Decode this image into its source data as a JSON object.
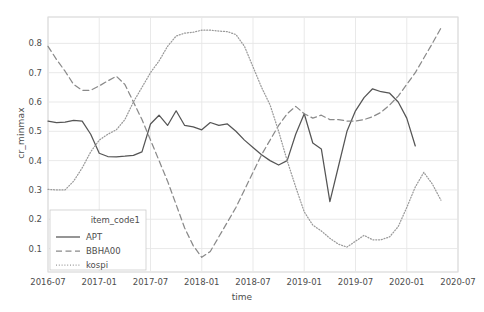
{
  "chart_data": {
    "type": "line",
    "title": "",
    "xlabel": "time",
    "ylabel": "cr_minmax",
    "legend_title": "item_code1",
    "legend_position": "lower left",
    "grid": true,
    "xlim": [
      "2016-07",
      "2020-07"
    ],
    "ylim": [
      0.02,
      0.89
    ],
    "xticks": [
      "2016-07",
      "2017-01",
      "2017-07",
      "2018-01",
      "2018-07",
      "2019-01",
      "2019-07",
      "2020-01",
      "2020-07"
    ],
    "yticks": [
      0.1,
      0.2,
      0.3,
      0.4,
      0.5,
      0.6,
      0.7,
      0.8
    ],
    "colors": {
      "APT": "#555555",
      "BBHA00": "#8a8a8a",
      "kospi": "#9a9a9a",
      "grid": "#e6e6e6",
      "axis": "#cccccc",
      "text": "#4d4d4d"
    },
    "series": [
      {
        "name": "APT",
        "style": "solid",
        "x": [
          "2016-07",
          "2016-08",
          "2016-09",
          "2016-10",
          "2016-11",
          "2016-12",
          "2017-01",
          "2017-02",
          "2017-03",
          "2017-04",
          "2017-05",
          "2017-06",
          "2017-07",
          "2017-08",
          "2017-09",
          "2017-10",
          "2017-11",
          "2017-12",
          "2018-01",
          "2018-02",
          "2018-03",
          "2018-04",
          "2018-05",
          "2018-06",
          "2018-07",
          "2018-08",
          "2018-09",
          "2018-10",
          "2018-11",
          "2018-12",
          "2019-01",
          "2019-02",
          "2019-03",
          "2019-04",
          "2019-05",
          "2019-06",
          "2019-07",
          "2019-08",
          "2019-09",
          "2019-10",
          "2019-11",
          "2019-12",
          "2020-01",
          "2020-02"
        ],
        "y": [
          0.535,
          0.53,
          0.531,
          0.537,
          0.535,
          0.49,
          0.425,
          0.414,
          0.413,
          0.415,
          0.418,
          0.43,
          0.525,
          0.555,
          0.52,
          0.57,
          0.52,
          0.515,
          0.505,
          0.53,
          0.52,
          0.525,
          0.5,
          0.47,
          0.445,
          0.42,
          0.4,
          0.385,
          0.4,
          0.49,
          0.56,
          0.46,
          0.44,
          0.26,
          0.38,
          0.5,
          0.57,
          0.615,
          0.645,
          0.635,
          0.63,
          0.6,
          0.545,
          0.45
        ]
      },
      {
        "name": "BBHA00",
        "style": "dashed",
        "x": [
          "2016-07",
          "2016-08",
          "2016-09",
          "2016-10",
          "2016-11",
          "2016-12",
          "2017-01",
          "2017-02",
          "2017-03",
          "2017-04",
          "2017-05",
          "2017-06",
          "2017-07",
          "2017-08",
          "2017-09",
          "2017-10",
          "2017-11",
          "2017-12",
          "2018-01",
          "2018-02",
          "2018-03",
          "2018-04",
          "2018-05",
          "2018-06",
          "2018-07",
          "2018-08",
          "2018-09",
          "2018-10",
          "2018-11",
          "2018-12",
          "2019-01",
          "2019-02",
          "2019-03",
          "2019-04",
          "2019-05",
          "2019-06",
          "2019-07",
          "2019-08",
          "2019-09",
          "2019-10",
          "2019-11",
          "2019-12",
          "2020-01",
          "2020-02",
          "2020-03",
          "2020-04",
          "2020-05"
        ],
        "y": [
          0.79,
          0.745,
          0.705,
          0.66,
          0.64,
          0.64,
          0.655,
          0.672,
          0.688,
          0.66,
          0.6,
          0.54,
          0.47,
          0.4,
          0.33,
          0.25,
          0.17,
          0.11,
          0.07,
          0.09,
          0.14,
          0.19,
          0.24,
          0.3,
          0.36,
          0.42,
          0.47,
          0.52,
          0.56,
          0.585,
          0.56,
          0.545,
          0.555,
          0.54,
          0.54,
          0.535,
          0.535,
          0.54,
          0.55,
          0.565,
          0.59,
          0.62,
          0.66,
          0.7,
          0.75,
          0.8,
          0.852
        ]
      },
      {
        "name": "kospi",
        "style": "dotted",
        "x": [
          "2016-07",
          "2016-08",
          "2016-09",
          "2016-10",
          "2016-11",
          "2016-12",
          "2017-01",
          "2017-02",
          "2017-03",
          "2017-04",
          "2017-05",
          "2017-06",
          "2017-07",
          "2017-08",
          "2017-09",
          "2017-10",
          "2017-11",
          "2017-12",
          "2018-01",
          "2018-02",
          "2018-03",
          "2018-04",
          "2018-05",
          "2018-06",
          "2018-07",
          "2018-08",
          "2018-09",
          "2018-10",
          "2018-11",
          "2018-12",
          "2019-01",
          "2019-02",
          "2019-03",
          "2019-04",
          "2019-05",
          "2019-06",
          "2019-07",
          "2019-08",
          "2019-09",
          "2019-10",
          "2019-11",
          "2019-12",
          "2020-01",
          "2020-02",
          "2020-03",
          "2020-04",
          "2020-05"
        ],
        "y": [
          0.302,
          0.3,
          0.3,
          0.33,
          0.375,
          0.43,
          0.47,
          0.49,
          0.505,
          0.54,
          0.6,
          0.65,
          0.7,
          0.74,
          0.79,
          0.825,
          0.835,
          0.838,
          0.845,
          0.845,
          0.842,
          0.84,
          0.83,
          0.79,
          0.72,
          0.65,
          0.59,
          0.5,
          0.4,
          0.31,
          0.225,
          0.18,
          0.16,
          0.135,
          0.115,
          0.105,
          0.125,
          0.145,
          0.13,
          0.13,
          0.14,
          0.175,
          0.24,
          0.31,
          0.36,
          0.32,
          0.265
        ]
      }
    ]
  },
  "legend": {
    "title": "item_code1",
    "entries": [
      {
        "label": "APT",
        "style": "solid"
      },
      {
        "label": "BBHA00",
        "style": "dashed"
      },
      {
        "label": "kospi",
        "style": "dotted"
      }
    ]
  },
  "axes": {
    "xlabel": "time",
    "ylabel": "cr_minmax",
    "xticks": [
      "2016-07",
      "2017-01",
      "2017-07",
      "2018-01",
      "2018-07",
      "2019-01",
      "2019-07",
      "2020-01",
      "2020-07"
    ],
    "yticks": [
      "0.1",
      "0.2",
      "0.3",
      "0.4",
      "0.5",
      "0.6",
      "0.7",
      "0.8"
    ]
  }
}
